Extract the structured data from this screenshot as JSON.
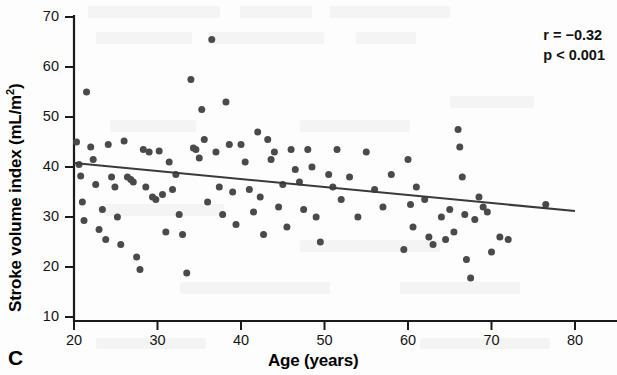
{
  "figure": {
    "panel_label": "C",
    "background_color": "#fdfdfd",
    "point_color": "#4a4a4a",
    "axis_color": "#1a1a1a",
    "line_color": "#3a3a3a"
  },
  "annotations": {
    "correlation": "r = −0.32",
    "pvalue": "p < 0.001"
  },
  "axis_titles": {
    "x": "Age (years)",
    "y_main": "Stroke volume index (mL/m",
    "y_sup": "2",
    "y_close": ")"
  },
  "chart_data": {
    "type": "scatter",
    "title": "",
    "xlabel": "Age (years)",
    "ylabel": "Stroke volume index (mL/m2)",
    "xlim": [
      20,
      80
    ],
    "ylim": [
      10,
      70
    ],
    "xticks": [
      20,
      30,
      40,
      50,
      60,
      70,
      80
    ],
    "yticks": [
      10,
      20,
      30,
      40,
      50,
      60,
      70
    ],
    "grid": false,
    "legend": null,
    "annotations": [
      "r = −0.32",
      "p < 0.001"
    ],
    "trendline": {
      "type": "linear-regression",
      "x": [
        20,
        80
      ],
      "y": [
        40.8,
        31.2
      ],
      "slope": -0.16,
      "intercept": 44.0
    },
    "series": [
      {
        "name": "Subjects",
        "marker": "circle",
        "color": "#4a4a4a",
        "points": [
          [
            20.3,
            45.0
          ],
          [
            20.6,
            40.5
          ],
          [
            20.8,
            38.2
          ],
          [
            21.0,
            33.0
          ],
          [
            21.2,
            29.3
          ],
          [
            21.5,
            55.0
          ],
          [
            22.0,
            44.0
          ],
          [
            22.3,
            41.5
          ],
          [
            22.6,
            36.5
          ],
          [
            23.0,
            27.5
          ],
          [
            23.4,
            31.5
          ],
          [
            23.8,
            25.5
          ],
          [
            24.1,
            44.5
          ],
          [
            24.5,
            38.0
          ],
          [
            24.9,
            36.0
          ],
          [
            25.2,
            30.0
          ],
          [
            25.6,
            24.5
          ],
          [
            26.0,
            45.2
          ],
          [
            26.4,
            38.0
          ],
          [
            26.8,
            37.5
          ],
          [
            27.1,
            37.0
          ],
          [
            27.5,
            22.0
          ],
          [
            27.9,
            19.5
          ],
          [
            28.3,
            43.5
          ],
          [
            28.6,
            36.0
          ],
          [
            29.0,
            43.0
          ],
          [
            29.4,
            34.0
          ],
          [
            29.8,
            33.5
          ],
          [
            30.2,
            43.2
          ],
          [
            30.6,
            34.5
          ],
          [
            31.0,
            27.0
          ],
          [
            31.4,
            41.0
          ],
          [
            31.8,
            35.5
          ],
          [
            32.2,
            38.5
          ],
          [
            32.6,
            30.5
          ],
          [
            33.0,
            26.5
          ],
          [
            33.5,
            18.8
          ],
          [
            34.0,
            57.5
          ],
          [
            34.3,
            43.8
          ],
          [
            34.6,
            43.5
          ],
          [
            35.0,
            41.8
          ],
          [
            35.3,
            51.5
          ],
          [
            35.6,
            45.5
          ],
          [
            36.0,
            33.0
          ],
          [
            36.5,
            65.5
          ],
          [
            37.0,
            43.0
          ],
          [
            37.4,
            36.0
          ],
          [
            37.8,
            30.5
          ],
          [
            38.2,
            53.0
          ],
          [
            38.6,
            44.5
          ],
          [
            39.0,
            35.0
          ],
          [
            39.4,
            28.5
          ],
          [
            40.0,
            44.5
          ],
          [
            40.5,
            41.0
          ],
          [
            41.0,
            35.5
          ],
          [
            41.5,
            31.0
          ],
          [
            42.0,
            47.0
          ],
          [
            42.3,
            34.0
          ],
          [
            42.7,
            26.5
          ],
          [
            43.2,
            45.5
          ],
          [
            43.6,
            41.5
          ],
          [
            44.0,
            43.0
          ],
          [
            44.5,
            32.0
          ],
          [
            45.0,
            36.5
          ],
          [
            45.5,
            28.0
          ],
          [
            46.0,
            43.5
          ],
          [
            46.5,
            39.5
          ],
          [
            47.0,
            37.0
          ],
          [
            47.5,
            31.5
          ],
          [
            48.0,
            43.5
          ],
          [
            48.5,
            40.0
          ],
          [
            49.0,
            30.0
          ],
          [
            49.5,
            25.0
          ],
          [
            50.5,
            38.5
          ],
          [
            51.0,
            36.0
          ],
          [
            51.5,
            43.5
          ],
          [
            52.0,
            33.5
          ],
          [
            53.0,
            38.0
          ],
          [
            54.0,
            30.0
          ],
          [
            55.0,
            43.0
          ],
          [
            56.0,
            35.5
          ],
          [
            57.0,
            32.0
          ],
          [
            58.0,
            38.5
          ],
          [
            59.5,
            23.5
          ],
          [
            60.0,
            41.5
          ],
          [
            60.3,
            32.5
          ],
          [
            60.6,
            28.0
          ],
          [
            61.0,
            36.0
          ],
          [
            62.0,
            33.5
          ],
          [
            62.5,
            26.0
          ],
          [
            63.0,
            24.5
          ],
          [
            64.0,
            30.0
          ],
          [
            64.5,
            25.5
          ],
          [
            65.0,
            31.5
          ],
          [
            65.5,
            27.0
          ],
          [
            66.0,
            47.5
          ],
          [
            66.2,
            44.0
          ],
          [
            66.5,
            38.0
          ],
          [
            66.8,
            30.5
          ],
          [
            67.0,
            21.5
          ],
          [
            67.5,
            17.8
          ],
          [
            68.0,
            29.5
          ],
          [
            68.5,
            34.0
          ],
          [
            69.0,
            32.0
          ],
          [
            69.5,
            31.0
          ],
          [
            70.0,
            23.0
          ],
          [
            71.0,
            26.0
          ],
          [
            72.0,
            25.5
          ],
          [
            76.5,
            32.5
          ]
        ]
      }
    ]
  }
}
